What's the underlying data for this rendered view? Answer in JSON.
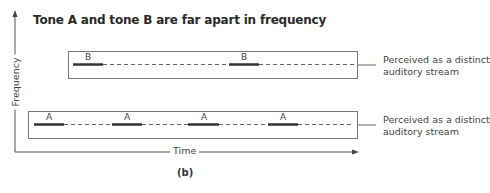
{
  "diagram": {
    "title": "Tone A and tone B are far apart in frequency",
    "caption": "(b)",
    "axes": {
      "x_label": "Time",
      "y_label": "Frequency"
    },
    "streams": [
      {
        "id": "B",
        "tone_label": "B",
        "tones": [
          "B",
          "B"
        ],
        "annotation_line1": "Perceived as a distinct",
        "annotation_line2": "auditory stream"
      },
      {
        "id": "A",
        "tone_label": "A",
        "tones": [
          "A",
          "A",
          "A",
          "A"
        ],
        "annotation_line1": "Perceived as a distinct",
        "annotation_line2": "auditory stream"
      }
    ],
    "colors": {
      "line": "#555555",
      "tone": "#333333",
      "box": "#777777"
    }
  }
}
